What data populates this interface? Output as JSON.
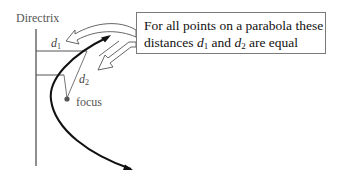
{
  "diagram": {
    "directrix_label": "Directrix",
    "focus_label": "focus",
    "d1": {
      "letter": "d",
      "subscript": "1"
    },
    "d2": {
      "letter": "d",
      "subscript": "2"
    },
    "note": {
      "line1": "For all points on a parabola these",
      "line2_prefix": "distances ",
      "d1_letter": "d",
      "d1_sub": "1",
      "and_word": " and ",
      "d2_letter": "d",
      "d2_sub": "2",
      "line2_suffix": " are equal"
    },
    "colors": {
      "curve": "#111111",
      "lines": "#444444",
      "focus_dot": "#555555",
      "box_border": "#7a7a7a",
      "callout_arrow": "#555555"
    }
  }
}
